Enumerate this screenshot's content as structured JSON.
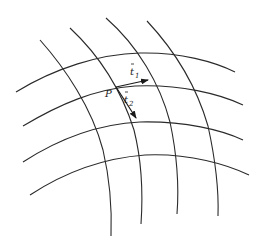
{
  "diagram": {
    "type": "curvilinear-coordinate-grid",
    "point_label": "P",
    "vectors": [
      {
        "name": "t1",
        "label": "t",
        "subscript": "1",
        "has_bar": true
      },
      {
        "name": "t2",
        "label": "t",
        "subscript": "2",
        "has_bar": true
      }
    ],
    "coordinate_curves": {
      "family_1_count": 4,
      "family_2_count": 4
    },
    "stroke_color": "#2a2a2a"
  }
}
